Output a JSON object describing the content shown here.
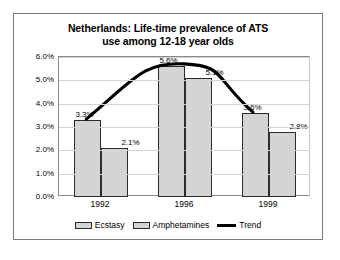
{
  "chart_data": {
    "type": "bar",
    "title": "Netherlands: Life-time prevalence of ATS use among 12-18 year olds",
    "title_line1": "Netherlands: Life-time prevalence of ATS",
    "title_line2": "use among 12-18 year olds",
    "categories": [
      "1992",
      "1996",
      "1999"
    ],
    "series": [
      {
        "name": "Ecstasy",
        "values": [
          3.3,
          5.6,
          3.6
        ],
        "labels": [
          "3.3%",
          "5.6%",
          "3.6%"
        ],
        "color": "#d4d4d4"
      },
      {
        "name": "Amphetamines",
        "values": [
          2.1,
          5.1,
          2.8
        ],
        "labels": [
          "2.1%",
          "5.1%",
          "2.8%"
        ],
        "color": "#d4d4d4"
      },
      {
        "name": "Trend",
        "type": "line",
        "values": [
          3.3,
          5.7,
          3.6
        ],
        "color": "#000000"
      }
    ],
    "xlabel": "",
    "ylabel": "",
    "ylim": [
      0,
      6
    ],
    "ytick_values": [
      0,
      1,
      2,
      3,
      4,
      5,
      6
    ],
    "ytick_labels": [
      "0.0%",
      "1.0%",
      "2.0%",
      "3.0%",
      "4.0%",
      "5.0%",
      "6.0%"
    ],
    "grid": true,
    "legend_position": "bottom",
    "legend": [
      "Ecstasy",
      "Amphetamines",
      "Trend"
    ]
  },
  "legend": {
    "ecstasy": "Ecstasy",
    "amphetamines": "Amphetamines",
    "trend": "Trend"
  }
}
